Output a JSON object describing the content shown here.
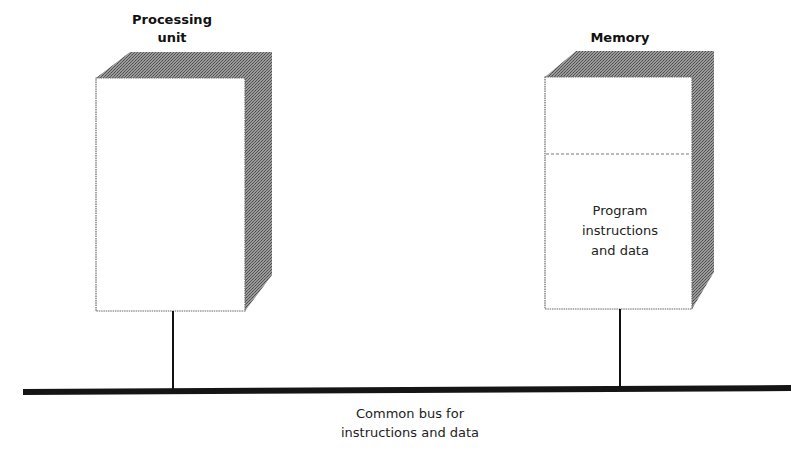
{
  "diagram": {
    "type": "von-neumann-architecture",
    "processing_unit": {
      "title_line1": "Processing",
      "title_line2": "unit"
    },
    "memory": {
      "title": "Memory",
      "content_line1": "Program",
      "content_line2": "instructions",
      "content_line3": "and data"
    },
    "bus": {
      "label_line1": "Common bus for",
      "label_line2": "instructions and data"
    },
    "colors": {
      "line": "#111111",
      "shade": "#8a8a8a",
      "face": "#ffffff",
      "divider": "#888888"
    }
  }
}
